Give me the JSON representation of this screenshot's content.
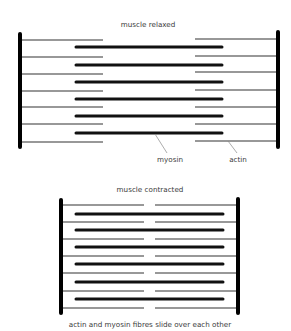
{
  "relaxed": {
    "title": "muscle relaxed",
    "title_pos": [
      148,
      27
    ],
    "z_left": {
      "x": 20,
      "y1": 34,
      "y2": 147
    },
    "z_right": {
      "x": 278,
      "y1": 32,
      "y2": 147
    },
    "actin_left": {
      "x1": 21,
      "x2": 103,
      "ys": [
        40,
        57,
        74,
        91,
        107,
        124,
        142
      ]
    },
    "actin_right": {
      "x1": 195,
      "x2": 277,
      "ys": [
        39,
        56,
        72,
        90,
        107,
        124,
        141
      ]
    },
    "myosin": {
      "x1": 76,
      "x2": 222,
      "ys": [
        47,
        65,
        82,
        99,
        116,
        133
      ]
    },
    "labels": [
      {
        "text": "myosin",
        "x": 170,
        "y": 162,
        "leader": [
          155,
          134,
          167,
          153
        ]
      },
      {
        "text": "actin",
        "x": 238,
        "y": 162,
        "leader": [
          228,
          141,
          237,
          153
        ]
      }
    ]
  },
  "contracted": {
    "title": "muscle contracted",
    "title_pos": [
      150,
      192
    ],
    "z_left": {
      "x": 61,
      "y1": 200,
      "y2": 313
    },
    "z_right": {
      "x": 238,
      "y1": 199,
      "y2": 313
    },
    "actin_left": {
      "x1": 62,
      "x2": 144,
      "ys": [
        205,
        222,
        239,
        256,
        273,
        291,
        308
      ]
    },
    "actin_right": {
      "x1": 155,
      "x2": 237,
      "ys": [
        205,
        222,
        239,
        256,
        273,
        291,
        308
      ]
    },
    "myosin": {
      "x1": 76,
      "x2": 223,
      "ys": [
        214,
        230,
        247,
        264,
        282,
        299
      ]
    }
  },
  "caption": {
    "text": "actin and myosin fibres slide over each other",
    "x": 150,
    "y": 327
  }
}
